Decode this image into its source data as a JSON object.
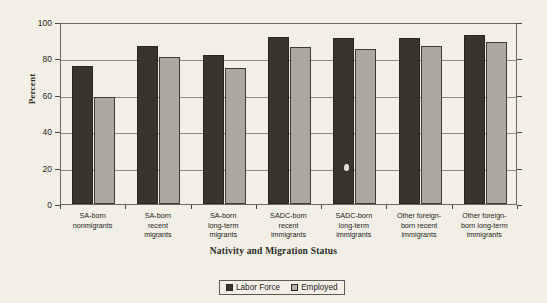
{
  "chart_data": {
    "type": "bar",
    "title": "",
    "xlabel": "Nativity and Migration Status",
    "ylabel": "Percent",
    "ylim": [
      0,
      100
    ],
    "yticks": [
      0,
      20,
      40,
      60,
      80,
      100
    ],
    "grid": true,
    "legend_position": "bottom-center",
    "categories": [
      "SA-born nonmigrants",
      "SA-born recent migrants",
      "SA-born long-term migrants",
      "SADC-born recent immigrants",
      "SADC-born long-term immigrants",
      "Other foreign-born recent immigrants",
      "Other foreign-born long-term immigrants"
    ],
    "category_lines": [
      [
        "SA-born",
        "nonmigrants"
      ],
      [
        "SA-born",
        "recent",
        "migrants"
      ],
      [
        "SA-born",
        "long-term",
        "migrants"
      ],
      [
        "SADC-born",
        "recent",
        "immigrants"
      ],
      [
        "SADC-born",
        "long-term",
        "immigrants"
      ],
      [
        "Other foreign-",
        "born recent",
        "immigrants"
      ],
      [
        "Other foreign-",
        "born long-term",
        "immigrants"
      ]
    ],
    "series": [
      {
        "name": "Labor Force",
        "color": "#3a352c",
        "values": [
          76,
          87,
          82,
          92,
          91,
          91,
          93
        ]
      },
      {
        "name": "Employed",
        "color": "#aba99f",
        "values": [
          59,
          81,
          75,
          86,
          85,
          87,
          89
        ]
      }
    ]
  },
  "axis": {
    "y_title": "Percent",
    "x_title": "Nativity and Migration Status",
    "y_tick_labels": [
      "100",
      "80",
      "60",
      "40",
      "20",
      "0"
    ]
  },
  "legend": {
    "items": [
      {
        "label": "Labor Force",
        "color": "#3a352c"
      },
      {
        "label": "Employed",
        "color": "#b4b2a8"
      }
    ]
  }
}
